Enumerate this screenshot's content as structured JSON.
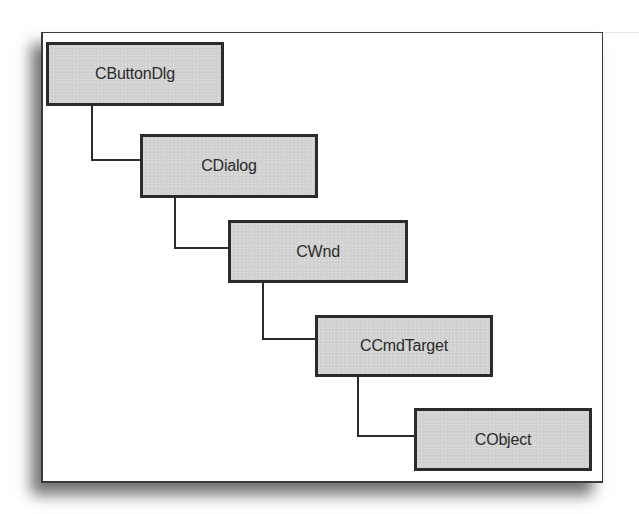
{
  "diagram": {
    "type": "class-hierarchy",
    "nodes": [
      {
        "id": "cbuttondlg",
        "label": "CButtonDlg",
        "x": 46,
        "y": 42,
        "w": 178,
        "h": 64
      },
      {
        "id": "cdialog",
        "label": "CDialog",
        "x": 140,
        "y": 134,
        "w": 178,
        "h": 64
      },
      {
        "id": "cwnd",
        "label": "CWnd",
        "x": 228,
        "y": 220,
        "w": 180,
        "h": 63
      },
      {
        "id": "ccmdtarget",
        "label": "CCmdTarget",
        "x": 315,
        "y": 315,
        "w": 178,
        "h": 62
      },
      {
        "id": "cobject",
        "label": "CObject",
        "x": 414,
        "y": 408,
        "w": 178,
        "h": 63
      }
    ],
    "edges": [
      {
        "from": "cbuttondlg",
        "to": "cdialog"
      },
      {
        "from": "cdialog",
        "to": "cwnd"
      },
      {
        "from": "cwnd",
        "to": "ccmdtarget"
      },
      {
        "from": "ccmdtarget",
        "to": "cobject"
      }
    ],
    "colors": {
      "node_fill": "#d3d3d3",
      "node_border": "#2b2b2b",
      "text": "#2a2a2a",
      "frame_border": "#3a3a3a",
      "background": "#ffffff"
    }
  }
}
